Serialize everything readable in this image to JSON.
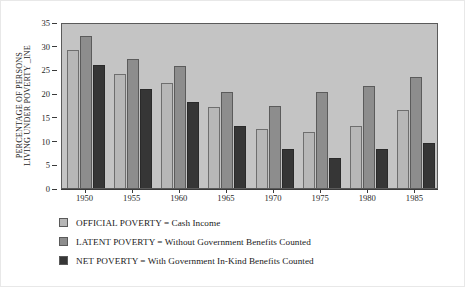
{
  "chart_data": {
    "type": "bar",
    "title": "",
    "subtitle": "",
    "xlabel": "",
    "ylabel": "PERCENTAGE OF PERSONS LIVING UNDER POVERTY _INE",
    "ylabel_lines": [
      "PERCENTAGE OF PERSONS",
      "LIVING UNDER POVERTY _INE"
    ],
    "categories": [
      "1950",
      "1955",
      "1960",
      "1965",
      "1970",
      "1975",
      "1980",
      "1985"
    ],
    "ylim": [
      0,
      35
    ],
    "yticks": [
      0,
      5,
      10,
      15,
      20,
      25,
      30,
      35
    ],
    "ytick_labels": [
      "0",
      "5",
      "10",
      "15",
      "20",
      "25",
      "30",
      "35"
    ],
    "grid": false,
    "legend_position": "below",
    "series": [
      {
        "name": "OFFICIAL POVERTY",
        "legend_label": "OFFICIAL POVERTY = Cash Income",
        "color": "#b7b7b7",
        "values": [
          29,
          24,
          22.2,
          17,
          12.5,
          11.8,
          13,
          16.4
        ]
      },
      {
        "name": "LATENT POVERTY",
        "legend_label": "LATENT POVERTY = Without Government Benefits Counted",
        "color": "#8d8d8d",
        "values": [
          32,
          27.2,
          25.8,
          20.2,
          17.3,
          20.3,
          21.6,
          23.5
        ]
      },
      {
        "name": "NET POVERTY",
        "legend_label": "NET POVERTY = With Government In-Kind Benefits Counted",
        "color": "#363636",
        "values": [
          26,
          20.8,
          18.2,
          13,
          8.2,
          6.3,
          8.2,
          9.5
        ]
      }
    ]
  },
  "colors": {
    "plot_background": "#c4c4c4",
    "page_background": "#ffffff",
    "axis": "#3a3a3a",
    "series_official": "#b7b7b7",
    "series_latent": "#8d8d8d",
    "series_net": "#363636"
  }
}
